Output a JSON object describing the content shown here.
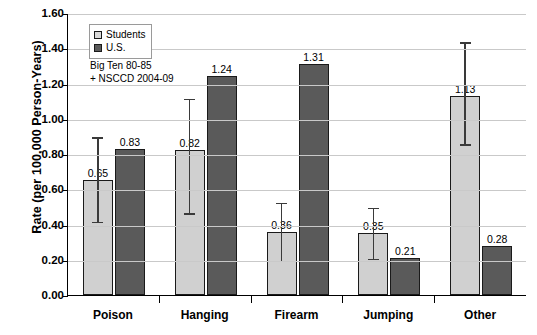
{
  "chart_data": {
    "type": "bar",
    "title": "",
    "xlabel": "",
    "ylabel": "Rate (per 100,000 Person-Years)",
    "ylim": [
      0.0,
      1.6
    ],
    "ytick_step": 0.2,
    "ytick_labels": [
      "0.00",
      "0.20",
      "0.40",
      "0.60",
      "0.80",
      "1.00",
      "1.20",
      "1.40",
      "1.60"
    ],
    "grid": true,
    "legend_position": "top-left-inside",
    "categories": [
      "Poison",
      "Hanging",
      "Firearm",
      "Jumping",
      "Other"
    ],
    "series": [
      {
        "name": "Students",
        "color": "#d0d0d0",
        "values": [
          0.65,
          0.82,
          0.36,
          0.35,
          1.13
        ],
        "labels": [
          "0.65",
          "0.82",
          "0.36",
          "0.35",
          "1.13"
        ],
        "error_low": [
          0.42,
          0.47,
          0.2,
          0.21,
          0.86
        ],
        "error_high": [
          0.9,
          1.12,
          0.53,
          0.5,
          1.44
        ]
      },
      {
        "name": "U.S.",
        "color": "#5a5a5a",
        "values": [
          0.83,
          1.24,
          1.31,
          0.21,
          0.28
        ],
        "labels": [
          "0.83",
          "1.24",
          "1.31",
          "0.21",
          "0.28"
        ],
        "error_low": [
          null,
          null,
          null,
          null,
          null
        ],
        "error_high": [
          null,
          null,
          null,
          null,
          null
        ]
      }
    ],
    "annotations": [
      "Big Ten 80-85",
      "+ NSCCD 2004-09"
    ]
  }
}
